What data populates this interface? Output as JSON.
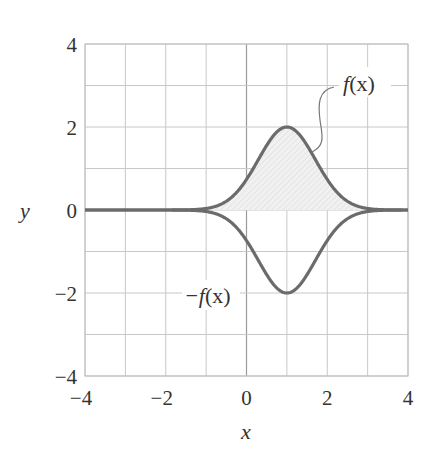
{
  "chart_data": {
    "type": "line",
    "title": "",
    "xlabel": "x",
    "ylabel": "y",
    "xlim": [
      -4,
      4
    ],
    "ylim": [
      -4,
      4
    ],
    "grid": true,
    "grid_step": 1,
    "x_ticks": [
      -4,
      -2,
      0,
      2,
      4
    ],
    "y_ticks": [
      -4,
      -2,
      0,
      2,
      4
    ],
    "x_tick_labels": [
      "−4",
      "−2",
      "0",
      "2",
      "4"
    ],
    "y_tick_labels": [
      "−4",
      "−2",
      "0",
      "2",
      "4"
    ],
    "legend": null,
    "series": [
      {
        "name": "f(x)",
        "formula_estimate": "2·exp(−(x−1)²)",
        "x": [
          -4,
          -3,
          -2,
          -1,
          -0.5,
          0,
          0.5,
          1,
          1.5,
          2,
          2.5,
          3,
          4
        ],
        "values": [
          0.0,
          0.0,
          0.0,
          0.04,
          0.21,
          0.74,
          1.56,
          2.0,
          1.56,
          0.74,
          0.21,
          0.04,
          0.0
        ],
        "shaded_to_zero": true
      },
      {
        "name": "−f(x)",
        "x": [
          -4,
          -3,
          -2,
          -1,
          -0.5,
          0,
          0.5,
          1,
          1.5,
          2,
          2.5,
          3,
          4
        ],
        "values": [
          0.0,
          0.0,
          0.0,
          -0.04,
          -0.21,
          -0.74,
          -1.56,
          -2.0,
          -1.56,
          -0.74,
          -0.21,
          -0.04,
          0.0
        ]
      }
    ],
    "annotations": [
      {
        "text": "f(x)",
        "position": [
          2.1,
          3.05
        ],
        "leader_to": [
          2.2,
          0.9
        ]
      },
      {
        "text": "−f(x)",
        "position": [
          0,
          -2
        ]
      }
    ],
    "colors": {
      "curve": "#6b6b6b",
      "grid": "#c8c8c8",
      "frame": "#bdbdbd",
      "fill": "#e6e6e6",
      "text": "#333333"
    }
  },
  "labels": {
    "f_main": "f",
    "f_paren": "(x)",
    "neg_f_main": "−f",
    "neg_f_paren": "(x)",
    "x_axis": "x",
    "y_axis": "y"
  }
}
